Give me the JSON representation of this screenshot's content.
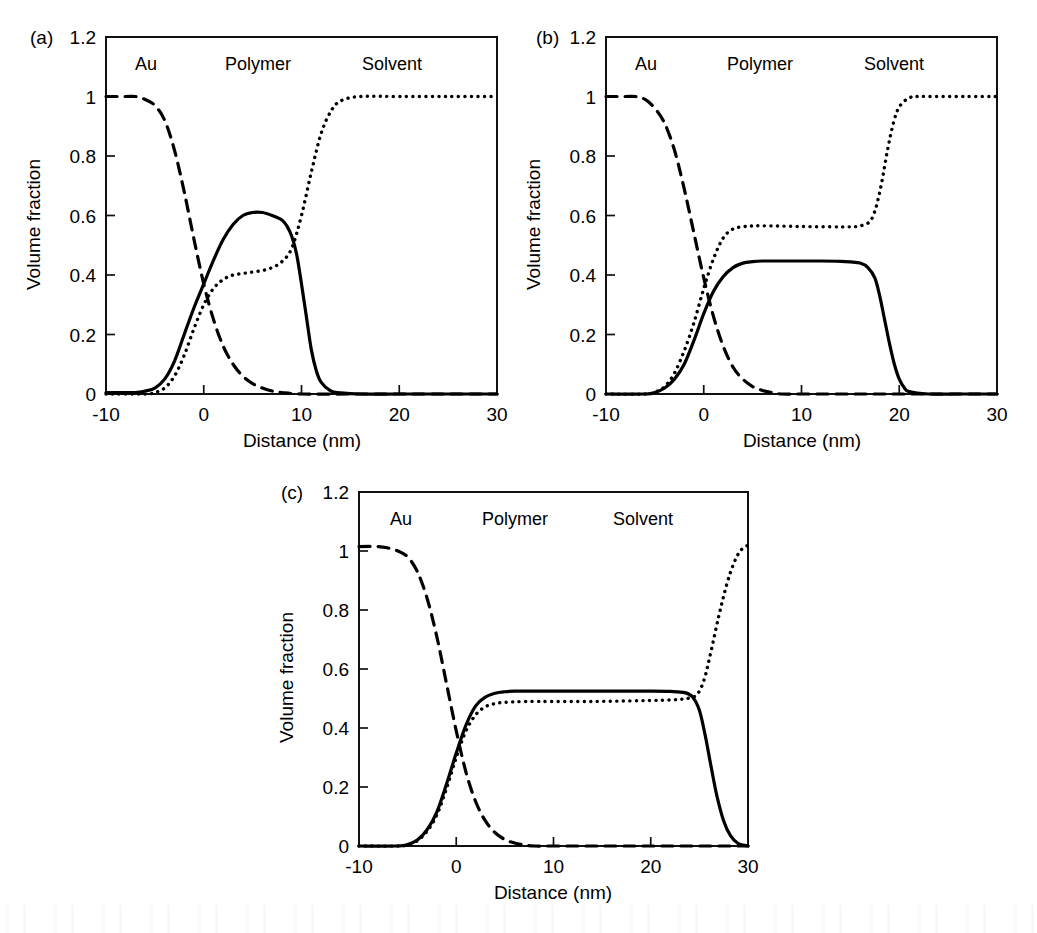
{
  "figure": {
    "panels": [
      {
        "id": "a",
        "letter": "(a)",
        "region_labels": [
          "Au",
          "Polymer",
          "Solvent"
        ]
      },
      {
        "id": "b",
        "letter": "(b)",
        "region_labels": [
          "Au",
          "Polymer",
          "Solvent"
        ]
      },
      {
        "id": "c",
        "letter": "(c)",
        "region_labels": [
          "Au",
          "Polymer",
          "Solvent"
        ]
      }
    ]
  },
  "chart_data": [
    {
      "type": "line",
      "panel": "a",
      "title": "",
      "xlabel": "Distance (nm)",
      "ylabel": "Volume fraction",
      "xlim": [
        -10,
        30
      ],
      "ylim": [
        0,
        1.2
      ],
      "xticks": [
        -10,
        0,
        10,
        20,
        30
      ],
      "xticklabels": [
        "-10",
        "0",
        "10",
        "20",
        "30"
      ],
      "yticks": [
        0,
        0.2,
        0.4,
        0.6,
        0.8,
        1,
        1.2
      ],
      "yticklabels": [
        "0",
        "0.2",
        "0.4",
        "0.6",
        "0.8",
        "1",
        "1.2"
      ],
      "grid": false,
      "legend": "none",
      "annotations": [
        "Au",
        "Polymer",
        "Solvent"
      ],
      "series": [
        {
          "name": "Au",
          "style": "dashed",
          "x": [
            -10,
            -8,
            -7,
            -6,
            -5,
            -4,
            -3,
            -2,
            -1,
            0,
            1,
            2,
            3,
            4,
            5,
            6,
            7,
            8,
            10,
            15,
            20,
            25,
            30
          ],
          "values": [
            1.0,
            1.0,
            1.0,
            0.99,
            0.97,
            0.92,
            0.82,
            0.68,
            0.52,
            0.37,
            0.25,
            0.16,
            0.1,
            0.06,
            0.035,
            0.02,
            0.01,
            0.005,
            0.0,
            0.0,
            0.0,
            0.0,
            0.0
          ]
        },
        {
          "name": "Polymer",
          "style": "solid",
          "x": [
            -10,
            -7,
            -6,
            -5,
            -4,
            -3,
            -2,
            -1,
            0,
            1,
            2,
            3,
            4,
            5,
            6,
            7,
            8,
            8.5,
            9,
            9.5,
            10,
            10.5,
            11,
            11.5,
            12,
            13,
            14,
            16,
            20,
            25,
            30
          ],
          "values": [
            0.005,
            0.005,
            0.01,
            0.02,
            0.05,
            0.11,
            0.2,
            0.29,
            0.37,
            0.45,
            0.52,
            0.57,
            0.6,
            0.61,
            0.61,
            0.6,
            0.585,
            0.565,
            0.53,
            0.47,
            0.37,
            0.26,
            0.15,
            0.08,
            0.04,
            0.01,
            0.004,
            0.0,
            0.0,
            0.0,
            0.0
          ]
        },
        {
          "name": "Solvent",
          "style": "dotted",
          "x": [
            -10,
            -6,
            -5,
            -4,
            -3,
            -2,
            -1,
            0,
            1,
            2,
            3,
            4,
            5,
            6,
            7,
            8,
            9,
            10,
            11,
            12,
            13,
            14,
            16,
            20,
            25,
            30
          ],
          "values": [
            0.0,
            0.0,
            0.005,
            0.02,
            0.06,
            0.13,
            0.22,
            0.3,
            0.355,
            0.385,
            0.4,
            0.405,
            0.41,
            0.415,
            0.425,
            0.445,
            0.49,
            0.6,
            0.745,
            0.875,
            0.95,
            0.985,
            1.0,
            1.0,
            1.0,
            1.0
          ]
        }
      ]
    },
    {
      "type": "line",
      "panel": "b",
      "title": "",
      "xlabel": "Distance (nm)",
      "ylabel": "Volume fraction",
      "xlim": [
        -10,
        30
      ],
      "ylim": [
        0,
        1.2
      ],
      "xticks": [
        -10,
        0,
        10,
        20,
        30
      ],
      "xticklabels": [
        "-10",
        "0",
        "10",
        "20",
        "30"
      ],
      "yticks": [
        0,
        0.2,
        0.4,
        0.6,
        0.8,
        1,
        1.2
      ],
      "yticklabels": [
        "0",
        "0.2",
        "0.4",
        "0.6",
        "0.8",
        "1",
        "1.2"
      ],
      "grid": false,
      "legend": "none",
      "annotations": [
        "Au",
        "Polymer",
        "Solvent"
      ],
      "series": [
        {
          "name": "Au",
          "style": "dashed",
          "x": [
            -10,
            -8,
            -7,
            -6,
            -5,
            -4,
            -3,
            -2,
            -1,
            0,
            1,
            2,
            3,
            4,
            5,
            6,
            7,
            8,
            10,
            15,
            20,
            25,
            30
          ],
          "values": [
            1.0,
            1.0,
            1.0,
            0.99,
            0.96,
            0.91,
            0.82,
            0.69,
            0.54,
            0.39,
            0.26,
            0.16,
            0.09,
            0.05,
            0.025,
            0.012,
            0.005,
            0.0,
            0.0,
            0.0,
            0.0,
            0.0,
            0.0
          ]
        },
        {
          "name": "Polymer",
          "style": "solid",
          "x": [
            -10,
            -6,
            -5,
            -4,
            -3,
            -2,
            -1,
            0,
            1,
            2,
            3,
            4,
            5,
            6,
            8,
            10,
            12,
            14,
            15,
            16,
            16.8,
            17.5,
            18,
            18.5,
            19,
            19.5,
            20,
            20.5,
            21,
            23,
            26,
            30
          ],
          "values": [
            0.0,
            0.0,
            0.005,
            0.02,
            0.05,
            0.1,
            0.18,
            0.27,
            0.345,
            0.395,
            0.425,
            0.44,
            0.445,
            0.447,
            0.447,
            0.447,
            0.447,
            0.446,
            0.444,
            0.44,
            0.425,
            0.39,
            0.33,
            0.25,
            0.17,
            0.1,
            0.05,
            0.022,
            0.008,
            0.0,
            0.0,
            0.0
          ]
        },
        {
          "name": "Solvent",
          "style": "dotted",
          "x": [
            -10,
            -6,
            -5,
            -4,
            -3,
            -2,
            -1,
            0,
            1,
            2,
            3,
            4,
            5,
            7,
            10,
            13,
            15,
            16,
            17,
            17.6,
            18.2,
            18.8,
            19.4,
            20,
            21,
            22,
            24,
            27,
            30
          ],
          "values": [
            0.0,
            0.0,
            0.006,
            0.025,
            0.07,
            0.145,
            0.24,
            0.355,
            0.455,
            0.525,
            0.555,
            0.562,
            0.565,
            0.565,
            0.563,
            0.562,
            0.562,
            0.565,
            0.58,
            0.625,
            0.71,
            0.82,
            0.91,
            0.965,
            0.995,
            1.0,
            1.0,
            1.0,
            1.0
          ]
        }
      ]
    },
    {
      "type": "line",
      "panel": "c",
      "title": "",
      "xlabel": "Distance (nm)",
      "ylabel": "Volume fraction",
      "xlim": [
        -10,
        30
      ],
      "ylim": [
        0,
        1.2
      ],
      "xticks": [
        -10,
        0,
        10,
        20,
        30
      ],
      "xticklabels": [
        "-10",
        "0",
        "10",
        "20",
        "30"
      ],
      "yticks": [
        0,
        0.2,
        0.4,
        0.6,
        0.8,
        1,
        1.2
      ],
      "yticklabels": [
        "0",
        "0.2",
        "0.4",
        "0.6",
        "0.8",
        "1",
        "1.2"
      ],
      "grid": false,
      "legend": "none",
      "annotations": [
        "Au",
        "Polymer",
        "Solvent"
      ],
      "series": [
        {
          "name": "Au",
          "style": "dashed",
          "x": [
            -10,
            -8,
            -7,
            -6,
            -5,
            -4,
            -3,
            -2,
            -1,
            0,
            1,
            2,
            3,
            4,
            5,
            6,
            7,
            8,
            10,
            15,
            20,
            25,
            30
          ],
          "values": [
            1.015,
            1.015,
            1.01,
            1.0,
            0.98,
            0.93,
            0.84,
            0.71,
            0.55,
            0.39,
            0.25,
            0.15,
            0.085,
            0.045,
            0.022,
            0.01,
            0.004,
            0.0,
            0.0,
            0.0,
            0.0,
            0.0,
            0.0
          ]
        },
        {
          "name": "Polymer",
          "style": "solid",
          "x": [
            -10,
            -6,
            -5,
            -4,
            -3,
            -2,
            -1,
            0,
            1,
            2,
            3,
            4,
            5,
            6,
            8,
            12,
            16,
            20,
            22,
            23.5,
            24.3,
            25,
            25.6,
            26.2,
            26.8,
            27.5,
            28.2,
            29,
            30
          ],
          "values": [
            0.0,
            0.0,
            0.005,
            0.02,
            0.055,
            0.115,
            0.21,
            0.315,
            0.41,
            0.475,
            0.505,
            0.518,
            0.523,
            0.525,
            0.525,
            0.525,
            0.525,
            0.525,
            0.524,
            0.52,
            0.505,
            0.46,
            0.375,
            0.27,
            0.17,
            0.085,
            0.035,
            0.008,
            0.0
          ]
        },
        {
          "name": "Solvent",
          "style": "dotted",
          "x": [
            -10,
            -6,
            -5,
            -4,
            -3,
            -2,
            -1,
            0,
            1,
            2,
            3,
            4,
            5,
            7,
            10,
            14,
            18,
            21,
            23,
            24,
            24.8,
            25.5,
            26.2,
            27,
            27.8,
            28.5,
            29.2,
            30
          ],
          "values": [
            0.0,
            0.0,
            0.004,
            0.018,
            0.05,
            0.105,
            0.195,
            0.3,
            0.39,
            0.445,
            0.472,
            0.483,
            0.487,
            0.49,
            0.49,
            0.49,
            0.492,
            0.494,
            0.497,
            0.502,
            0.515,
            0.565,
            0.66,
            0.78,
            0.885,
            0.955,
            1.0,
            1.02
          ]
        }
      ]
    }
  ]
}
